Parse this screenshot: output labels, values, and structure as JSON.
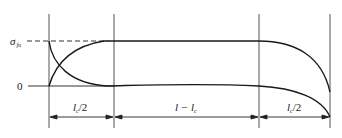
{
  "diagram": {
    "type": "stress-distribution-along-fiber",
    "y_labels": {
      "max_symbol": "σ",
      "max_subscript": "fu",
      "zero": "0"
    },
    "segments": [
      {
        "label_main": "l",
        "label_sub": "c",
        "label_suffix": "/2"
      },
      {
        "label_main": "l − l",
        "label_sub": "c",
        "label_suffix": ""
      },
      {
        "label_main": "l",
        "label_sub": "c",
        "label_suffix": "/2"
      }
    ],
    "curves": [
      {
        "name": "fiber-tensile-stress",
        "description": "rises from 0 to σ_fu over l_c/2, constant over l − l_c, falls to near 0 at right end"
      },
      {
        "name": "interface-shear-stress",
        "description": "maximum at left end, decays to 0 over l_c/2, ~0 over l − l_c, rises in magnitude (negative) at right end"
      }
    ],
    "colors": {
      "line": "#1a1a1a",
      "guide": "#555555"
    }
  }
}
